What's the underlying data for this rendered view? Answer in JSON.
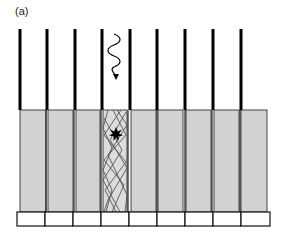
{
  "panel_label": "(a)",
  "colors": {
    "septa": "#000000",
    "crystal_fill": "#d2d2d2",
    "crystal_border": "#444444",
    "trajectory": "#555555",
    "interaction": "#000000",
    "light_guide_fill": "#ffffff",
    "light_guide_border": "#000000"
  },
  "septa": {
    "count": 9,
    "x_positions": [
      20,
      47,
      75,
      102,
      129,
      157,
      185,
      212,
      240
    ],
    "top_y": 29,
    "bottom_y": 110
  },
  "crystals": {
    "count": 9,
    "top_y": 110,
    "bottom_y": 212,
    "highlighted_index": 3
  },
  "light_guides": {
    "count": 9,
    "top_y": 212,
    "bottom_y": 226
  },
  "incident_photon": {
    "label": "gamma-ray",
    "x": 115,
    "y_start": 34,
    "y_end": 78
  },
  "interaction_point": {
    "x": 116,
    "y": 134
  }
}
